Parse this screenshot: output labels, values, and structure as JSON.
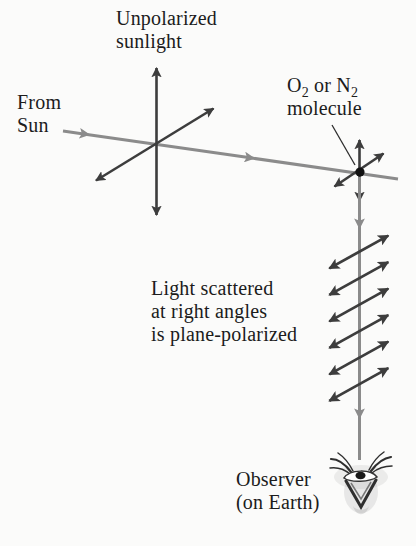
{
  "labels": {
    "unpolarized": {
      "line1": "Unpolarized",
      "line2": "sunlight"
    },
    "from_sun": {
      "line1": "From",
      "line2": "Sun"
    },
    "molecule": {
      "p1": "O",
      "s1": "2",
      "p2": " or N",
      "s2": "2",
      "line2": "molecule"
    },
    "scattered": {
      "line1": "Light scattered",
      "line2": "at right angles",
      "line3": "is plane-polarized"
    },
    "observer": {
      "line1": "Observer",
      "line2": "(on Earth)"
    }
  },
  "icons": {
    "observer": "eye-icon",
    "molecule": "molecule-dot"
  },
  "colors": {
    "background": "#fbfbfa",
    "text": "#1c1c1c",
    "ray": "#8b8b8b",
    "efield": "#3d3d3d",
    "molecule_dot": "#111111"
  }
}
